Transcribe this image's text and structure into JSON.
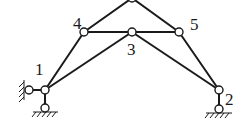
{
  "diagram": {
    "type": "truss",
    "nodes": [
      {
        "id": "1",
        "label": "1"
      },
      {
        "id": "2",
        "label": "2"
      },
      {
        "id": "3",
        "label": "3"
      },
      {
        "id": "4",
        "label": "4"
      },
      {
        "id": "5",
        "label": "5"
      },
      {
        "id": "top",
        "label": ""
      }
    ],
    "members": [
      [
        "1",
        "4"
      ],
      [
        "4",
        "top"
      ],
      [
        "top",
        "5"
      ],
      [
        "5",
        "2"
      ],
      [
        "4",
        "3"
      ],
      [
        "3",
        "5"
      ],
      [
        "1",
        "3"
      ],
      [
        "3",
        "2"
      ]
    ],
    "supports": [
      {
        "node": "1",
        "type": "horizontal-link-to-wall"
      },
      {
        "node": "1",
        "type": "vertical-link-to-ground"
      },
      {
        "node": "2",
        "type": "vertical-link-to-ground"
      }
    ],
    "colors": {
      "line": "#1a1a1a",
      "background": "#ffffff"
    }
  }
}
